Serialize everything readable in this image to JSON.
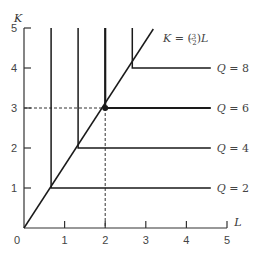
{
  "chart_data": {
    "type": "line",
    "title": "",
    "xlabel": "L",
    "ylabel": "K",
    "xlim": [
      0,
      5
    ],
    "ylim": [
      0,
      5
    ],
    "grid": false,
    "x_ticks": [
      0,
      1,
      2,
      3,
      4,
      5
    ],
    "y_ticks": [
      1,
      2,
      3,
      4,
      5
    ],
    "x_tick_labels": [
      "0",
      "1",
      "2",
      "3",
      "4",
      "5"
    ],
    "y_tick_labels": [
      "1",
      "2",
      "3",
      "4",
      "5"
    ],
    "expansion_path": {
      "label": "K = (3/2)L",
      "label_prefix": "K = (",
      "label_num": "3",
      "label_den": "2",
      "label_suffix": ")L",
      "slope": 1.5,
      "points": [
        [
          0,
          0
        ],
        [
          3.333,
          5
        ]
      ]
    },
    "series": [
      {
        "name": "Q = 2",
        "label_q": "Q",
        "label_val": "= 2",
        "kink": [
          0.667,
          1
        ],
        "points": [
          [
            0.667,
            5
          ],
          [
            0.667,
            1
          ],
          [
            4.6,
            1
          ]
        ]
      },
      {
        "name": "Q = 4",
        "label_q": "Q",
        "label_val": "= 4",
        "kink": [
          1.333,
          2
        ],
        "points": [
          [
            1.333,
            5
          ],
          [
            1.333,
            2
          ],
          [
            4.6,
            2
          ]
        ]
      },
      {
        "name": "Q = 6",
        "label_q": "Q",
        "label_val": "= 6",
        "kink": [
          2,
          3
        ],
        "points": [
          [
            2,
            5
          ],
          [
            2,
            3
          ],
          [
            4.6,
            3
          ]
        ]
      },
      {
        "name": "Q = 8",
        "label_q": "Q",
        "label_val": "= 8",
        "kink": [
          2.667,
          4
        ],
        "points": [
          [
            2.667,
            5
          ],
          [
            2.667,
            4
          ],
          [
            4.6,
            4
          ]
        ]
      }
    ],
    "highlight_point": {
      "x": 2,
      "y": 3,
      "dashed_guides": true
    },
    "annotations": [
      "K = (3/2)L",
      "Q = 8",
      "Q = 6",
      "Q = 4",
      "Q = 2"
    ]
  },
  "colors": {
    "line": "#1a1a1a",
    "axis": "#333333",
    "text": "#444444"
  }
}
